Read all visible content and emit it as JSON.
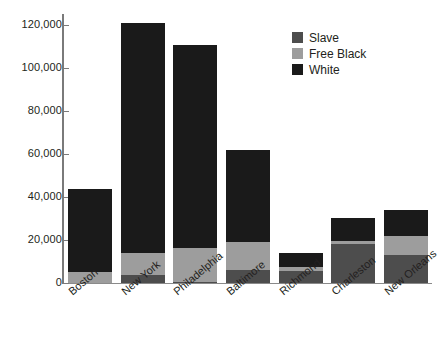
{
  "chart_data": {
    "type": "bar",
    "subtype": "stacked-bar",
    "title": "",
    "xlabel": "",
    "ylabel": "",
    "ylim": [
      0,
      125000
    ],
    "grid": false,
    "legend_position": "top-right",
    "categories": [
      "Boston",
      "New York",
      "Philadelphia",
      "Baltimore",
      "Richmond",
      "Charleston",
      "New Orleans"
    ],
    "y_ticks": [
      0,
      20000,
      40000,
      60000,
      80000,
      100000,
      120000
    ],
    "y_tick_labels": [
      "0",
      "20,000",
      "40,000",
      "60,000",
      "80,000",
      "100,000",
      "120,000"
    ],
    "series": [
      {
        "name": "Slave",
        "color": "#4d4d4d",
        "values": [
          0,
          3500,
          500,
          6000,
          5500,
          18000,
          13000
        ]
      },
      {
        "name": "Free Black",
        "color": "#9d9d9d",
        "values": [
          5000,
          10500,
          16000,
          13000,
          2000,
          1700,
          9000
        ]
      },
      {
        "name": "White",
        "color": "#1a1a1a",
        "values": [
          38500,
          107000,
          94000,
          43000,
          6500,
          10300,
          12000
        ]
      }
    ],
    "totals": [
      43500,
      121000,
      110500,
      62000,
      14000,
      30000,
      34000
    ]
  },
  "legend": {
    "items": [
      {
        "label": "Slave",
        "color": "#4d4d4d"
      },
      {
        "label": "Free Black",
        "color": "#9d9d9d"
      },
      {
        "label": "White",
        "color": "#1a1a1a"
      }
    ]
  }
}
